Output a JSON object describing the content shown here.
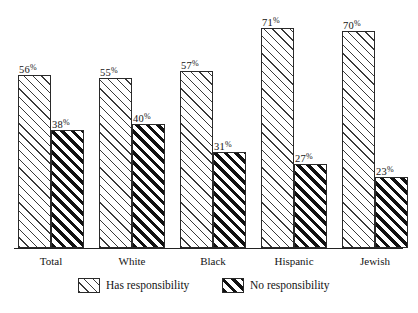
{
  "chart_data": {
    "type": "bar",
    "title": "",
    "subtitle": "",
    "xlabel": "",
    "ylabel": "",
    "ylim": [
      0,
      80
    ],
    "grid": false,
    "legend_position": "bottom",
    "value_suffix": "%",
    "categories": [
      "Total",
      "White",
      "Black",
      "Hispanic",
      "Jewish"
    ],
    "series": [
      {
        "name": "Has responsibility",
        "values": [
          56,
          55,
          57,
          71,
          70
        ],
        "labels": [
          "56%",
          "55%",
          "57%",
          "71%",
          "70%"
        ],
        "pattern": "thin-diagonal-hatch"
      },
      {
        "name": "No responsibility",
        "values": [
          38,
          40,
          31,
          27,
          23
        ],
        "labels": [
          "38%",
          "40%",
          "31%",
          "27%",
          "23%"
        ],
        "pattern": "thick-diagonal-hatch"
      }
    ]
  },
  "legend": {
    "items": [
      {
        "label": "Has responsibility",
        "swatch": "thin-diagonal-hatch-swatch"
      },
      {
        "label": "No responsibility",
        "swatch": "thick-diagonal-hatch-swatch"
      }
    ]
  },
  "axis": {
    "categories": [
      "Total",
      "White",
      "Black",
      "Hispanic",
      "Jewish"
    ]
  },
  "source_note": ""
}
